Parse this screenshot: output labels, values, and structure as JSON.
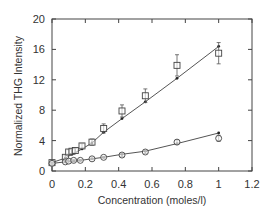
{
  "chart_data": {
    "type": "scatter",
    "title": "",
    "xlabel": "Concentration   (moles/l)",
    "ylabel": "Normalized THG Intensity",
    "xlim": [
      0,
      1.2
    ],
    "ylim": [
      0,
      20
    ],
    "xticks": [
      0,
      0.2,
      0.4,
      0.6,
      0.8,
      1,
      1.2
    ],
    "xtick_labels": [
      "0",
      "0.2",
      "0.4",
      "0.6",
      "0.8",
      "1",
      "1.2"
    ],
    "yticks": [
      0,
      4,
      8,
      12,
      16,
      20
    ],
    "ytick_labels": [
      "0",
      "4",
      "8",
      "12",
      "16",
      "20"
    ],
    "grid": false,
    "legend": null,
    "series": [
      {
        "name": "squares",
        "marker": "square",
        "x": [
          0,
          0.08,
          0.1,
          0.12,
          0.14,
          0.18,
          0.24,
          0.31,
          0.42,
          0.56,
          0.75,
          1.0
        ],
        "y": [
          1.1,
          1.8,
          2.5,
          2.6,
          2.7,
          3.3,
          3.8,
          5.6,
          7.9,
          9.9,
          13.9,
          15.5
        ],
        "err": [
          0.2,
          0.2,
          0.3,
          0.3,
          0.3,
          0.3,
          0.4,
          0.6,
          0.8,
          0.9,
          1.4,
          1.4
        ]
      },
      {
        "name": "circles",
        "marker": "circle",
        "x": [
          0,
          0.08,
          0.1,
          0.13,
          0.17,
          0.24,
          0.31,
          0.42,
          0.56,
          0.75,
          1.0
        ],
        "y": [
          1.0,
          1.2,
          1.3,
          1.4,
          1.4,
          1.6,
          1.8,
          2.1,
          2.5,
          3.8,
          4.3
        ],
        "err": [
          0.1,
          0.1,
          0.1,
          0.1,
          0.1,
          0.1,
          0.1,
          0.2,
          0.2,
          0.3,
          0.4
        ]
      },
      {
        "name": "fit-squares",
        "marker": "line",
        "x": [
          0,
          0.08,
          0.12,
          0.18,
          0.24,
          0.31,
          0.42,
          0.56,
          0.75,
          1.0
        ],
        "y": [
          1.1,
          1.7,
          2.2,
          2.9,
          3.7,
          5.1,
          6.9,
          9.1,
          12.2,
          16.4
        ]
      },
      {
        "name": "fit-circles",
        "marker": "line",
        "x": [
          0,
          0.08,
          0.13,
          0.17,
          0.24,
          0.31,
          0.42,
          0.56,
          0.75,
          1.0
        ],
        "y": [
          1.0,
          1.2,
          1.3,
          1.4,
          1.6,
          1.8,
          2.2,
          2.6,
          3.6,
          5.0
        ]
      }
    ]
  }
}
